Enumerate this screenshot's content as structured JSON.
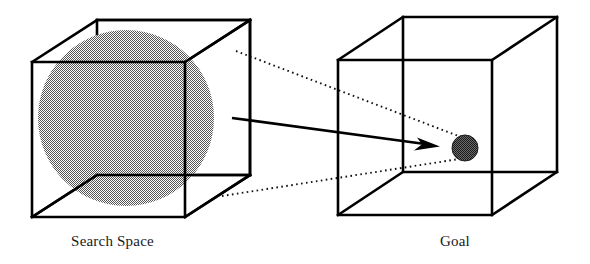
{
  "figure": {
    "kind": "conceptual-diagram",
    "background_color": "#ffffff",
    "line_color": "#000000",
    "sphere_fill_color": "#8a8a8a",
    "goal_fill_color": "#2b2b2b"
  },
  "captions": {
    "search_space": "Search Space",
    "goal": "Goal"
  },
  "left_panel": {
    "label": "Search Space",
    "cube": {
      "front_face": [
        [
          32,
          62
        ],
        [
          185,
          62
        ],
        [
          185,
          217
        ],
        [
          32,
          217
        ]
      ],
      "back_face": [
        [
          97,
          20
        ],
        [
          250,
          20
        ],
        [
          250,
          175
        ],
        [
          97,
          175
        ]
      ]
    },
    "sphere": {
      "name": "search-space-sphere",
      "center": [
        126,
        118
      ],
      "radius": 88,
      "fill": "#8a8a8a"
    }
  },
  "right_panel": {
    "label": "Goal",
    "cube": {
      "front_face": [
        [
          338,
          60
        ],
        [
          492,
          60
        ],
        [
          492,
          215
        ],
        [
          338,
          215
        ]
      ],
      "back_face": [
        [
          403,
          17
        ],
        [
          557,
          17
        ],
        [
          557,
          172
        ],
        [
          403,
          172
        ]
      ]
    },
    "goal_ball": {
      "name": "goal-ball",
      "center": [
        465,
        148
      ],
      "radius": 13,
      "fill": "#2b2b2b"
    }
  },
  "connectors": {
    "arrow": {
      "name": "transition-arrow",
      "start": [
        232,
        118
      ],
      "end": [
        437,
        146
      ]
    },
    "magnification_lines": [
      {
        "name": "upper-guide",
        "start": [
          236,
          51
        ],
        "end": [
          461,
          137
        ]
      },
      {
        "name": "lower-guide",
        "start": [
          222,
          196
        ],
        "end": [
          459,
          159
        ]
      }
    ]
  }
}
